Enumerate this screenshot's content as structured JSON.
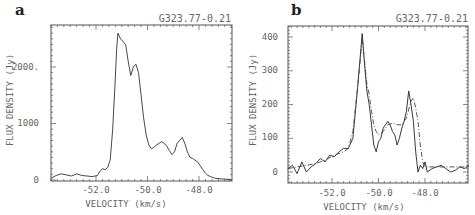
{
  "chart_data": [
    {
      "type": "line",
      "panel_label": "a",
      "title": "G323.77-0.21",
      "xlabel": "VELOCITY (km/s)",
      "ylabel": "FLUX DENSITY (Jy)",
      "xlim": [
        -53.75,
        -46.75
      ],
      "ylim": [
        0,
        2750
      ],
      "xticks": [
        -52.0,
        -50.0,
        -48.0
      ],
      "xtick_labels": [
        "-52.0",
        "-50.0",
        "-48.0"
      ],
      "yticks": [
        0,
        1000,
        2000
      ],
      "ytick_labels": [
        "0",
        "1000",
        "2000."
      ],
      "grid": false,
      "series": [
        {
          "name": "spectrum",
          "style": "solid",
          "x": [
            -53.75,
            -53.55,
            -53.35,
            -53.15,
            -52.95,
            -52.75,
            -52.55,
            -52.35,
            -52.15,
            -51.95,
            -51.85,
            -51.75,
            -51.65,
            -51.55,
            -51.45,
            -51.35,
            -51.25,
            -51.2,
            -51.15,
            -51.05,
            -50.95,
            -50.85,
            -50.75,
            -50.65,
            -50.55,
            -50.45,
            -50.35,
            -50.25,
            -50.15,
            -50.05,
            -49.95,
            -49.85,
            -49.75,
            -49.65,
            -49.55,
            -49.45,
            -49.35,
            -49.25,
            -49.15,
            -49.05,
            -48.95,
            -48.85,
            -48.75,
            -48.65,
            -48.55,
            -48.45,
            -48.35,
            -48.25,
            -48.15,
            -48.05,
            -47.95,
            -47.85,
            -47.75,
            -47.65,
            -47.55,
            -47.45,
            -47.35,
            -47.15,
            -46.95,
            -46.75
          ],
          "values": [
            30,
            80,
            110,
            90,
            70,
            110,
            80,
            70,
            60,
            80,
            150,
            200,
            180,
            220,
            350,
            900,
            1800,
            2300,
            2600,
            2500,
            2450,
            2400,
            2100,
            1850,
            2000,
            2050,
            1900,
            1500,
            1100,
            800,
            620,
            550,
            580,
            620,
            650,
            680,
            650,
            600,
            520,
            450,
            500,
            650,
            700,
            750,
            650,
            500,
            400,
            380,
            350,
            320,
            250,
            180,
            120,
            80,
            60,
            40,
            30,
            20,
            15,
            10
          ]
        }
      ]
    },
    {
      "type": "line",
      "panel_label": "b",
      "title": "G323.77-0.21",
      "xlabel": "VELOCITY (km/s)",
      "ylabel": "FLUX DENSITY (Jy)",
      "xlim": [
        -53.9,
        -46.0
      ],
      "ylim": [
        -30,
        430
      ],
      "xticks": [
        -52.0,
        -50.0,
        -48.0
      ],
      "xtick_labels": [
        "-52.0",
        "-50.0",
        "-48.0"
      ],
      "yticks": [
        0,
        100,
        200,
        300,
        400
      ],
      "ytick_labels": [
        "0",
        "100",
        "200",
        "300",
        "400"
      ],
      "grid": false,
      "series": [
        {
          "name": "observed",
          "style": "solid",
          "x": [
            -53.9,
            -53.7,
            -53.5,
            -53.3,
            -53.1,
            -52.9,
            -52.7,
            -52.5,
            -52.3,
            -52.1,
            -51.9,
            -51.7,
            -51.5,
            -51.3,
            -51.1,
            -50.9,
            -50.8,
            -50.7,
            -50.6,
            -50.5,
            -50.4,
            -50.3,
            -50.2,
            -50.1,
            -50.0,
            -49.9,
            -49.8,
            -49.7,
            -49.6,
            -49.5,
            -49.4,
            -49.3,
            -49.2,
            -49.1,
            -49.0,
            -48.9,
            -48.8,
            -48.7,
            -48.6,
            -48.5,
            -48.4,
            -48.3,
            -48.2,
            -48.1,
            -48.0,
            -47.9,
            -47.7,
            -47.5,
            -47.3,
            -47.1,
            -46.9,
            -46.7,
            -46.5,
            -46.3,
            -46.1
          ],
          "values": [
            10,
            20,
            -5,
            30,
            0,
            15,
            25,
            40,
            30,
            50,
            45,
            60,
            70,
            70,
            100,
            250,
            330,
            410,
            320,
            240,
            200,
            140,
            80,
            60,
            90,
            100,
            130,
            140,
            150,
            140,
            120,
            110,
            80,
            100,
            130,
            150,
            180,
            240,
            200,
            150,
            60,
            0,
            20,
            10,
            30,
            0,
            10,
            15,
            20,
            10,
            0,
            5,
            15,
            10,
            20
          ]
        },
        {
          "name": "model",
          "style": "dash-dot",
          "x": [
            -53.9,
            -53.5,
            -53.1,
            -52.7,
            -52.3,
            -51.9,
            -51.5,
            -51.3,
            -51.1,
            -50.9,
            -50.8,
            -50.7,
            -50.6,
            -50.5,
            -50.4,
            -50.3,
            -50.2,
            -50.1,
            -50.0,
            -49.8,
            -49.6,
            -49.4,
            -49.2,
            -49.0,
            -48.8,
            -48.6,
            -48.5,
            -48.4,
            -48.3,
            -48.2,
            -48.1,
            -48.0,
            -47.6,
            -47.2,
            -46.8,
            -46.4,
            -46.1
          ],
          "values": [
            10,
            15,
            20,
            25,
            35,
            50,
            60,
            70,
            120,
            250,
            320,
            400,
            330,
            260,
            230,
            180,
            140,
            120,
            110,
            120,
            140,
            145,
            140,
            140,
            160,
            210,
            220,
            190,
            150,
            80,
            30,
            15,
            15,
            15,
            15,
            15,
            15
          ]
        }
      ]
    }
  ],
  "panels": {
    "a": {
      "label": "a",
      "source": "G323.77-0.21",
      "xlabel": "VELOCITY (km/s)",
      "ylabel": "FLUX DENSITY (Jy)",
      "xticks": [
        "-52.0",
        "-50.0",
        "-48.0"
      ],
      "yticks": [
        "0",
        "1000",
        "2000."
      ]
    },
    "b": {
      "label": "b",
      "source": "G323.77-0.21",
      "xlabel": "VELOCITY (km/s)",
      "ylabel": "FLUX DENSITY (Jy)",
      "xticks": [
        "-52.0",
        "-50.0",
        "-48.0"
      ],
      "yticks": [
        "0",
        "100",
        "200",
        "300",
        "400"
      ]
    }
  }
}
